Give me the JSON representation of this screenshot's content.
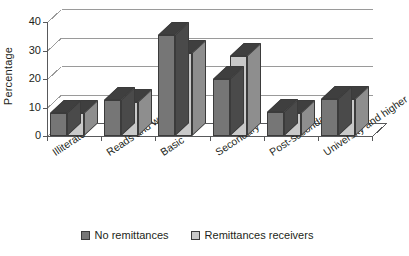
{
  "chart_data": {
    "type": "bar",
    "title": "",
    "subtitle": "",
    "xlabel": "",
    "ylabel": "Percentage",
    "ylim": [
      0,
      40
    ],
    "yticks": [
      0,
      10,
      20,
      30,
      40
    ],
    "grid": true,
    "style": "3d-clustered-column",
    "legend_position": "bottom",
    "categories": [
      "Illiterate",
      "Reads and write",
      "Basic",
      "Secondary",
      "Post-secondary",
      "University and higher"
    ],
    "series": [
      {
        "name": "No remittances",
        "color": "#767676",
        "values": [
          8,
          12.5,
          35.5,
          20,
          8.5,
          13
        ]
      },
      {
        "name": "Remittances receivers",
        "color": "#c9c9c9",
        "values": [
          8,
          12,
          29,
          28,
          8,
          13
        ]
      }
    ]
  },
  "axis": {
    "y_title": "Percentage",
    "y_tick_labels": [
      "40",
      "30",
      "20",
      "10",
      "0"
    ]
  },
  "legend": {
    "items": [
      {
        "label": "No remittances",
        "color": "#767676"
      },
      {
        "label": "Remittances receivers",
        "color": "#c9c9c9"
      }
    ]
  },
  "colors": {
    "series_dark": "#767676",
    "series_dark_top": "#3f3f3f",
    "series_dark_side": "#4a4a4a",
    "series_light": "#c9c9c9",
    "series_light_top": "#3f3f3f",
    "series_light_side": "#8e8e8e",
    "grid": "#9a9a9a",
    "axis": "#58595b",
    "text": "#231f20",
    "background": "#ffffff"
  }
}
